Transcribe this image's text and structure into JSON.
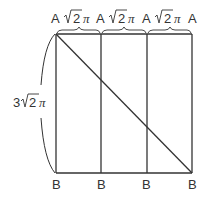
{
  "diagram": {
    "type": "unrolled-cylinder-net",
    "top_points": [
      "A",
      "A",
      "A",
      "A"
    ],
    "bottom_points": [
      "B",
      "B",
      "B",
      "B"
    ],
    "segment_labels": [
      {
        "coef": "",
        "radicand": "2",
        "pi": "π"
      },
      {
        "coef": "",
        "radicand": "2",
        "pi": "π"
      },
      {
        "coef": "",
        "radicand": "2",
        "pi": "π"
      }
    ],
    "height_label": {
      "coef": "3",
      "radicand": "2",
      "pi": "π"
    },
    "line_color": "#333333"
  }
}
